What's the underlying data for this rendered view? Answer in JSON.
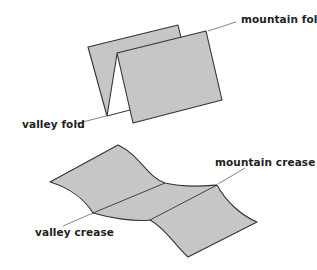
{
  "figure_top": {
    "labels": {
      "mountain": "mountain fold",
      "valley": "valley fold"
    }
  },
  "figure_bottom": {
    "labels": {
      "mountain": "mountain crease",
      "valley": "valley crease"
    }
  },
  "colors": {
    "paper_fill": "#c6c6c6",
    "stroke": "#333333",
    "leader": "#666666",
    "text": "#222222"
  }
}
